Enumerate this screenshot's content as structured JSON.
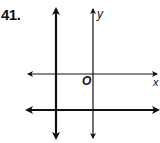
{
  "problem": {
    "number": "41."
  },
  "graph": {
    "axis_labels": {
      "x": "x",
      "y": "y",
      "origin": "O"
    },
    "lines": [
      {
        "name": "x-axis",
        "kind": "horizontal",
        "thickness": "thin"
      },
      {
        "name": "y-axis",
        "kind": "vertical",
        "thickness": "thin"
      },
      {
        "name": "line-vertical-left",
        "kind": "vertical",
        "thickness": "thick",
        "position": "left of y-axis"
      },
      {
        "name": "line-horizontal-below",
        "kind": "horizontal",
        "thickness": "thick",
        "position": "below x-axis"
      }
    ],
    "colors": {
      "line": "#111111",
      "background": "#ffffff"
    }
  }
}
